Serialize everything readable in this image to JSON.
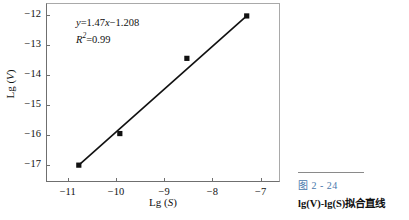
{
  "figure": {
    "caption_number": "图 2 - 24",
    "caption_text": "lg(V)-lg(S)拟合直线",
    "caption_number_color": "#4878ac"
  },
  "annotation": {
    "equation": "y=1.47x−1.208",
    "equation_y": "y",
    "equation_rest": "=1.47",
    "equation_x": "x",
    "equation_tail": "−1.208",
    "r_squared_symbol": "R",
    "r_squared_sup": "2",
    "r_squared_value": "=0.99"
  },
  "chart_data": {
    "type": "scatter",
    "title": "",
    "xlabel": "Lg (S)",
    "ylabel": "Lg (V)",
    "xlabel_prefix": "Lg (",
    "xlabel_var": "S",
    "xlabel_suffix": ")",
    "ylabel_prefix": "Lg (",
    "ylabel_var": "V",
    "ylabel_suffix": ")",
    "xlim": [
      -11.45,
      -6.6
    ],
    "ylim": [
      -17.55,
      -11.6
    ],
    "xticks": [
      -11,
      -10,
      -9,
      -8,
      -7
    ],
    "xticklabels": [
      "−11",
      "−10",
      "−9",
      "−8",
      "−7"
    ],
    "yticks": [
      -12,
      -13,
      -14,
      -15,
      -16,
      -17
    ],
    "yticklabels": [
      "−12",
      "−13",
      "−14",
      "−15",
      "−16",
      "−17"
    ],
    "grid": false,
    "legend": null,
    "series": [
      {
        "name": "lg(V) vs lg(S)",
        "marker": "square",
        "marker_color": "#111111",
        "x": [
          -10.77,
          -9.92,
          -8.53,
          -7.29
        ],
        "y": [
          -16.99,
          -15.94,
          -13.44,
          -12.03
        ]
      }
    ],
    "fit_line": {
      "name": "linear fit",
      "slope": 1.47,
      "intercept": -1.208,
      "r_squared": 0.99,
      "color": "#111111",
      "x_start": -10.77,
      "x_end": -7.29,
      "y_start": -16.99,
      "y_end": -12.03
    }
  }
}
